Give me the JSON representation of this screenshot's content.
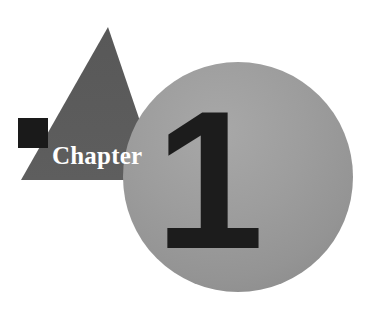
{
  "page": {
    "kind": "book-chapter-opener",
    "width": 374,
    "height": 309,
    "background_color": "#ffffff"
  },
  "opener": {
    "label": "Chapter",
    "number": "1",
    "label_color": "#ffffff",
    "number_color": "#1c1c1c"
  },
  "shapes": {
    "triangle": {
      "name": "triangle",
      "fill": "#5a5a5a",
      "apex_x": 108,
      "apex_y": 27,
      "base_left_x": 21,
      "base_right_x": 160,
      "base_y": 180
    },
    "square": {
      "name": "square",
      "fill": "#1a1a1a",
      "x": 18,
      "y": 118,
      "width": 30,
      "height": 30
    },
    "circle": {
      "name": "circle",
      "fill": "#9b9b9b",
      "fill_light": "#a9a9a9",
      "fill_dark": "#8f8f8f",
      "center_x": 238,
      "center_y": 177,
      "radius": 115
    }
  }
}
